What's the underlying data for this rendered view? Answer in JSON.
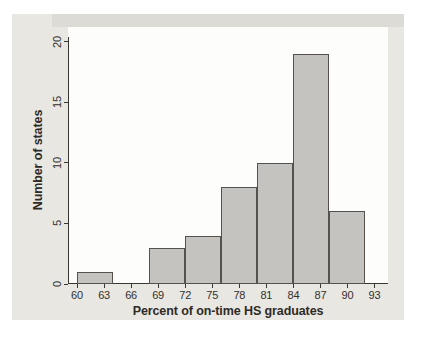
{
  "chart_data": {
    "type": "bar",
    "subtype": "histogram",
    "title": "",
    "xlabel": "Percent of on-time HS graduates",
    "ylabel": "Number of states",
    "bins": [
      {
        "x0": 60,
        "x1": 64,
        "count": 1
      },
      {
        "x0": 64,
        "x1": 68,
        "count": 0
      },
      {
        "x0": 68,
        "x1": 72,
        "count": 3
      },
      {
        "x0": 72,
        "x1": 76,
        "count": 4
      },
      {
        "x0": 76,
        "x1": 80,
        "count": 8
      },
      {
        "x0": 80,
        "x1": 84,
        "count": 10
      },
      {
        "x0": 84,
        "x1": 88,
        "count": 19
      },
      {
        "x0": 88,
        "x1": 92,
        "count": 6
      }
    ],
    "x_ticks": [
      60,
      63,
      66,
      69,
      72,
      75,
      78,
      81,
      84,
      87,
      90,
      93
    ],
    "y_ticks": [
      0,
      5,
      10,
      15,
      20
    ],
    "x_range": [
      59,
      94.5
    ],
    "y_range": [
      0,
      21.2
    ],
    "grid": false,
    "legend": null,
    "colors": {
      "panel_bg": "#e9e7e2",
      "plot_bg": "#fdfdfb",
      "bar_fill": "#c5c3c0",
      "bar_border": "#55524d",
      "axis": "#3a3733",
      "text": "#2e2b27"
    }
  }
}
